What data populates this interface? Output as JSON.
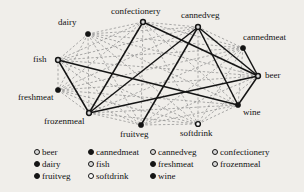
{
  "figure": {
    "type": "network-graph",
    "background": "#f0eeea",
    "edge_solid_color": "#141414",
    "edge_dashed_color": "#8a8a8a"
  },
  "nodes": [
    {
      "id": "dairy",
      "label": "dairy",
      "x": 88,
      "y": 34,
      "marker": "solid",
      "label_x": 58,
      "label_y": 18
    },
    {
      "id": "confectionery",
      "label": "confectionery",
      "x": 143,
      "y": 22,
      "marker": "ring",
      "label_x": 111,
      "label_y": 7
    },
    {
      "id": "cannedveg",
      "label": "cannedveg",
      "x": 198,
      "y": 27,
      "marker": "ring",
      "label_x": 181,
      "label_y": 11
    },
    {
      "id": "cannedmeat",
      "label": "cannedmeat",
      "x": 243,
      "y": 48,
      "marker": "solid",
      "label_x": 243,
      "label_y": 33
    },
    {
      "id": "fish",
      "label": "fish",
      "x": 58,
      "y": 60,
      "marker": "ring",
      "label_x": 33,
      "label_y": 55
    },
    {
      "id": "beer",
      "label": "beer",
      "x": 258,
      "y": 76,
      "marker": "ring",
      "label_x": 265,
      "label_y": 71
    },
    {
      "id": "freshmeat",
      "label": "freshmeat",
      "x": 58,
      "y": 90,
      "marker": "solid",
      "label_x": 18,
      "label_y": 93
    },
    {
      "id": "wine",
      "label": "wine",
      "x": 238,
      "y": 105,
      "marker": "solid",
      "label_x": 243,
      "label_y": 108
    },
    {
      "id": "frozenmeal",
      "label": "frozenmeal",
      "x": 89,
      "y": 113,
      "marker": "ring",
      "label_x": 44,
      "label_y": 117
    },
    {
      "id": "fruitveg",
      "label": "fruitveg",
      "x": 141,
      "y": 125,
      "marker": "solid",
      "label_x": 120,
      "label_y": 130
    },
    {
      "id": "softdrink",
      "label": "softdrink",
      "x": 198,
      "y": 124,
      "marker": "hollow",
      "label_x": 180,
      "label_y": 129
    }
  ],
  "edges_strong": [
    [
      "fish",
      "wine"
    ],
    [
      "fish",
      "frozenmeal"
    ],
    [
      "confectionery",
      "frozenmeal"
    ],
    [
      "confectionery",
      "beer"
    ],
    [
      "cannedveg",
      "frozenmeal"
    ],
    [
      "cannedveg",
      "beer"
    ],
    [
      "cannedmeat",
      "beer"
    ],
    [
      "beer",
      "wine"
    ],
    [
      "beer",
      "frozenmeal"
    ],
    [
      "fruitveg",
      "cannedveg"
    ],
    [
      "wine",
      "cannedveg"
    ]
  ],
  "edges_weak": [
    [
      "dairy",
      "confectionery"
    ],
    [
      "dairy",
      "cannedveg"
    ],
    [
      "dairy",
      "beer"
    ],
    [
      "dairy",
      "fish"
    ],
    [
      "dairy",
      "frozenmeal"
    ],
    [
      "dairy",
      "fruitveg"
    ],
    [
      "dairy",
      "softdrink"
    ],
    [
      "dairy",
      "wine"
    ],
    [
      "dairy",
      "freshmeat"
    ],
    [
      "dairy",
      "cannedmeat"
    ],
    [
      "confectionery",
      "cannedveg"
    ],
    [
      "confectionery",
      "cannedmeat"
    ],
    [
      "confectionery",
      "fish"
    ],
    [
      "confectionery",
      "freshmeat"
    ],
    [
      "confectionery",
      "fruitveg"
    ],
    [
      "confectionery",
      "softdrink"
    ],
    [
      "confectionery",
      "wine"
    ],
    [
      "cannedveg",
      "cannedmeat"
    ],
    [
      "cannedveg",
      "fish"
    ],
    [
      "cannedveg",
      "freshmeat"
    ],
    [
      "cannedveg",
      "softdrink"
    ],
    [
      "cannedmeat",
      "fish"
    ],
    [
      "cannedmeat",
      "freshmeat"
    ],
    [
      "cannedmeat",
      "frozenmeal"
    ],
    [
      "cannedmeat",
      "fruitveg"
    ],
    [
      "cannedmeat",
      "softdrink"
    ],
    [
      "cannedmeat",
      "wine"
    ],
    [
      "fish",
      "beer"
    ],
    [
      "fish",
      "freshmeat"
    ],
    [
      "fish",
      "fruitveg"
    ],
    [
      "fish",
      "softdrink"
    ],
    [
      "freshmeat",
      "frozenmeal"
    ],
    [
      "freshmeat",
      "fruitveg"
    ],
    [
      "freshmeat",
      "softdrink"
    ],
    [
      "freshmeat",
      "wine"
    ],
    [
      "freshmeat",
      "beer"
    ],
    [
      "frozenmeal",
      "fruitveg"
    ],
    [
      "frozenmeal",
      "softdrink"
    ],
    [
      "frozenmeal",
      "wine"
    ],
    [
      "fruitveg",
      "softdrink"
    ],
    [
      "fruitveg",
      "wine"
    ],
    [
      "fruitveg",
      "beer"
    ],
    [
      "softdrink",
      "wine"
    ],
    [
      "softdrink",
      "beer"
    ]
  ],
  "legend": {
    "items": [
      {
        "label": "beer",
        "marker": "ring"
      },
      {
        "label": "dairy",
        "marker": "solid"
      },
      {
        "label": "fruitveg",
        "marker": "solid"
      },
      {
        "label": "cannedmeat",
        "marker": "solid"
      },
      {
        "label": "fish",
        "marker": "ring"
      },
      {
        "label": "softdrink",
        "marker": "hollow"
      },
      {
        "label": "cannedveg",
        "marker": "ring"
      },
      {
        "label": "freshmeat",
        "marker": "solid"
      },
      {
        "label": "wine",
        "marker": "solid"
      },
      {
        "label": "confectionery",
        "marker": "ring"
      },
      {
        "label": "frozenmeal",
        "marker": "ring"
      }
    ]
  }
}
